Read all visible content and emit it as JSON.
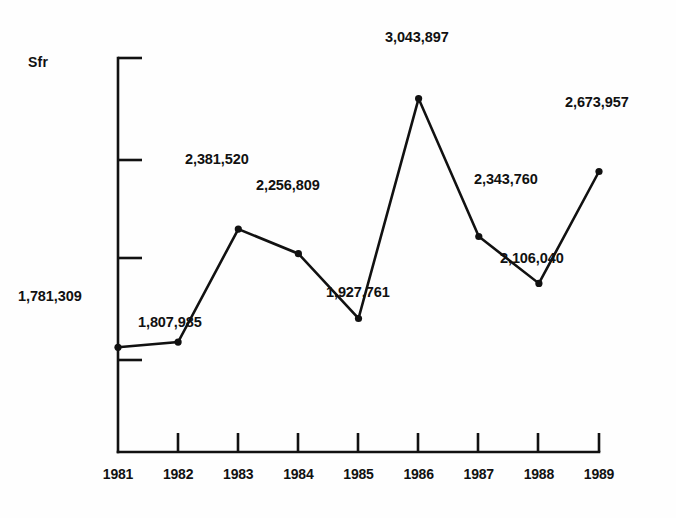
{
  "chart_data": {
    "type": "line",
    "title": "",
    "subtitle": "",
    "xlabel": "",
    "ylabel": "Sfr",
    "grid": false,
    "legend": false,
    "legend_position": "none",
    "x": [
      "1981",
      "1982",
      "1983",
      "1984",
      "1985",
      "1986",
      "1987",
      "1988",
      "1989"
    ],
    "categories": [
      "1981",
      "1982",
      "1983",
      "1984",
      "1985",
      "1986",
      "1987",
      "1988",
      "1989"
    ],
    "values": [
      1781309,
      1807985,
      2381520,
      2256809,
      1927761,
      3043897,
      2343760,
      2106040,
      2673957
    ],
    "value_labels": [
      "1,781,309",
      "1,807,985",
      "2,381,520",
      "2,256,809",
      "1,927,761",
      "3,043,897",
      "2,343,760",
      "2,106,040",
      "2,673,957"
    ],
    "series": [
      {
        "name": "Sfr",
        "values": [
          1781309,
          1807985,
          2381520,
          2256809,
          1927761,
          3043897,
          2343760,
          2106040,
          2673957
        ]
      }
    ],
    "ylim": [
      1250000,
      3250000
    ],
    "xlim": [
      "1981",
      "1989"
    ],
    "y_axis_ticks_unlabeled": 5,
    "marker": "filled-circle",
    "line_color": "#111111",
    "marker_color": "#111111",
    "axis_color": "#111111",
    "background_color": "#fefefe"
  },
  "axis": {
    "y_unit_label": "Sfr",
    "x_tick_labels": [
      "1981",
      "1982",
      "1983",
      "1984",
      "1985",
      "1986",
      "1987",
      "1988",
      "1989"
    ]
  },
  "data_labels": [
    {
      "year": "1981",
      "text": "1,781,309",
      "x": 18,
      "y": 288,
      "align": "right"
    },
    {
      "year": "1982",
      "text": "1,807,985",
      "x": 138,
      "y": 314,
      "align": "left"
    },
    {
      "year": "1983",
      "text": "2,381,520",
      "x": 185,
      "y": 151,
      "align": "left"
    },
    {
      "year": "1984",
      "text": "2,256,809",
      "x": 256,
      "y": 177,
      "align": "left"
    },
    {
      "year": "1985",
      "text": "1,927,761",
      "x": 326,
      "y": 284,
      "align": "left"
    },
    {
      "year": "1986",
      "text": "3,043,897",
      "x": 385,
      "y": 29,
      "align": "left"
    },
    {
      "year": "1987",
      "text": "2,343,760",
      "x": 474,
      "y": 171,
      "align": "left"
    },
    {
      "year": "1988",
      "text": "2,106,040",
      "x": 500,
      "y": 250,
      "align": "left"
    },
    {
      "year": "1989",
      "text": "2,673,957",
      "x": 565,
      "y": 94,
      "align": "left"
    }
  ]
}
